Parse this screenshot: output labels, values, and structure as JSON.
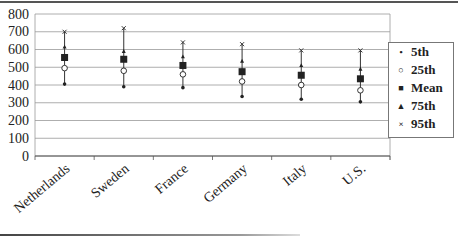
{
  "chart_data": {
    "type": "scatter",
    "title": "",
    "xlabel": "",
    "ylabel": "",
    "ylim": [
      0,
      800
    ],
    "yticks": [
      0,
      100,
      200,
      300,
      400,
      500,
      600,
      700,
      800
    ],
    "grid": true,
    "legend_position": "right",
    "categories": [
      "Netherlands",
      "Sweden",
      "France",
      "Germany",
      "Italy",
      "U.S."
    ],
    "series": [
      {
        "name": "5th",
        "marker": "small-dot",
        "values": [
          405,
          390,
          385,
          335,
          320,
          305
        ]
      },
      {
        "name": "25th",
        "marker": "open-circle",
        "values": [
          495,
          480,
          460,
          420,
          400,
          370
        ]
      },
      {
        "name": "Mean",
        "marker": "filled-square",
        "values": [
          555,
          545,
          510,
          475,
          455,
          435
        ]
      },
      {
        "name": "75th",
        "marker": "small-triangle",
        "values": [
          615,
          590,
          560,
          535,
          510,
          490
        ]
      },
      {
        "name": "95th",
        "marker": "x",
        "values": [
          700,
          720,
          640,
          630,
          595,
          595
        ]
      }
    ]
  },
  "legend": {
    "items": [
      {
        "label": "5th",
        "glyph": "•"
      },
      {
        "label": "25th",
        "glyph": "○"
      },
      {
        "label": "Mean",
        "glyph": "■"
      },
      {
        "label": "75th",
        "glyph": "▲"
      },
      {
        "label": "95th",
        "glyph": "×"
      }
    ]
  }
}
